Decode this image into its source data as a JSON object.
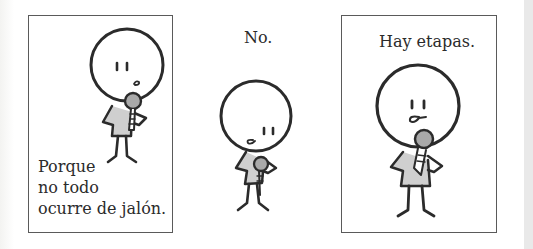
{
  "comic": {
    "language": "es",
    "panels": [
      {
        "id": 1,
        "bordered": true,
        "caption_lines": [
          "Porque",
          "no todo",
          "ocurre de jalón."
        ]
      },
      {
        "id": 2,
        "bordered": false,
        "caption": "No."
      },
      {
        "id": 3,
        "bordered": true,
        "caption": "Hay etapas."
      }
    ],
    "colors": {
      "ink": "#2b2b2b",
      "border": "#5a5a5a",
      "mic_gray": "#a9a9a9",
      "shirt_gray": "#cfcfcf",
      "gutter": "#e9e9e9"
    }
  }
}
